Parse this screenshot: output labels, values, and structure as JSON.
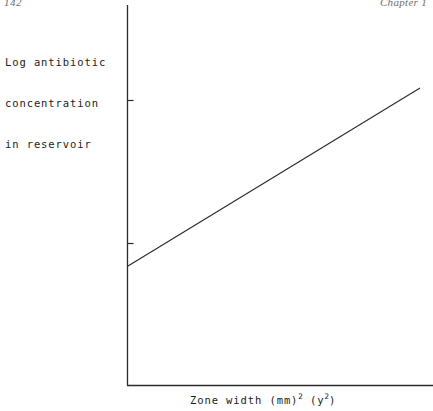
{
  "page": {
    "folio": "142",
    "running_head": "Chapter 1",
    "background_color": "#ffffff",
    "ink_color": "#2b2b2b"
  },
  "figure": {
    "y_axis_caption_line1": "Log antibiotic",
    "y_axis_caption_line2": "concentration",
    "y_axis_caption_line3": "in reservoir",
    "x_axis_caption_prefix": "Zone width (mm)",
    "x_axis_caption_exp1": "2",
    "x_axis_caption_mid": " (y",
    "x_axis_caption_exp2": "2",
    "x_axis_caption_suffix": ")"
  },
  "chart_data": {
    "type": "line",
    "title": "",
    "xlabel": "Zone width (mm)2 (y2)",
    "ylabel": "Log antibiotic concentration in reservoir",
    "grid": false,
    "legend": "none",
    "axes": {
      "x_axis_px": {
        "x1": 127,
        "y1": 385,
        "x2": 433,
        "y2": 385
      },
      "y_axis_px": {
        "x1": 127,
        "y1": 5,
        "x2": 127,
        "y2": 385
      },
      "x_tick_labels": [],
      "y_tick_labels": [],
      "y_ticks_px": [
        100,
        243
      ],
      "tick_length_px": 6,
      "tick_side": "inside-right"
    },
    "series": [
      {
        "name": "standard curve",
        "style": "solid straight line",
        "markers": "none",
        "points_px": [
          {
            "x": 128,
            "y": 266
          },
          {
            "x": 420,
            "y": 88
          }
        ],
        "values": [
          {
            "x": 0.0,
            "y": 0.0
          },
          {
            "x": 1.0,
            "y": 1.0
          }
        ]
      }
    ],
    "xlim": [
      0,
      1
    ],
    "ylim": [
      0,
      1
    ]
  }
}
